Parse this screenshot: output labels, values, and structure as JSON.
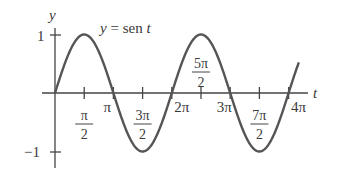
{
  "chart_data": {
    "type": "line",
    "title": "",
    "curve_label": "y = sen t",
    "curve_label_parts": {
      "lhs": "y",
      "eq": " = sen ",
      "var": "t"
    },
    "xlabel": "t",
    "ylabel": "y",
    "function": "sin(t)",
    "xlim": [
      0,
      12.566
    ],
    "ylim": [
      -1,
      1
    ],
    "grid": false,
    "legend": "none",
    "y_ticks": [
      {
        "value": 1,
        "label": "1"
      },
      {
        "value": -1,
        "label": "−1"
      }
    ],
    "x_ticks": [
      {
        "value": 1.5708,
        "label": "π/2",
        "num": "π",
        "den": "2",
        "position": "below"
      },
      {
        "value": 3.1416,
        "label": "π",
        "position": "below"
      },
      {
        "value": 4.7124,
        "label": "3π/2",
        "num": "3π",
        "den": "2",
        "position": "below"
      },
      {
        "value": 6.2832,
        "label": "2π",
        "position": "below"
      },
      {
        "value": 7.854,
        "label": "5π/2",
        "num": "5π",
        "den": "2",
        "position": "above"
      },
      {
        "value": 9.4248,
        "label": "3π",
        "position": "below"
      },
      {
        "value": 10.9956,
        "label": "7π/2",
        "num": "7π",
        "den": "2",
        "position": "below"
      },
      {
        "value": 12.5664,
        "label": "4π",
        "position": "below"
      }
    ],
    "x": [
      0,
      1.5708,
      3.1416,
      4.7124,
      6.2832,
      7.854,
      9.4248,
      10.9956,
      12.5664
    ],
    "values": [
      0,
      1,
      0,
      -1,
      0,
      1,
      0,
      -1,
      0
    ]
  }
}
